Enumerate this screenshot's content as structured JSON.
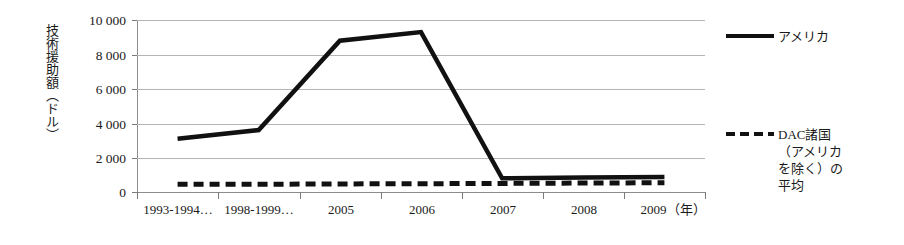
{
  "chart_data": {
    "type": "line",
    "title": "",
    "xlabel": "年",
    "ylabel": "技術援助額（ドル）",
    "ylim": [
      0,
      10000
    ],
    "ytick_values": [
      10000,
      8000,
      6000,
      4000,
      2000,
      0
    ],
    "ytick_labels": [
      "10 000",
      "8 000",
      "6 000",
      "4 000",
      "2 000",
      "0"
    ],
    "categories": [
      "1993-1994…",
      "1998-1999…",
      "2005",
      "2006",
      "2007",
      "2008",
      "2009"
    ],
    "xtick_labels": [
      "1993-1994…",
      "1998-1999…",
      "2005",
      "2006",
      "2007",
      "2008",
      "2009（年）"
    ],
    "grid": true,
    "legend_position": "right",
    "series": [
      {
        "name": "アメリカ",
        "style": "solid",
        "color": "#111111",
        "values": [
          3100,
          3600,
          8800,
          9300,
          800,
          850,
          870
        ]
      },
      {
        "name": "DAC諸国（アメリカを除く）の平均",
        "style": "dashed",
        "color": "#111111",
        "values": [
          450,
          450,
          470,
          480,
          500,
          520,
          540
        ]
      }
    ]
  },
  "axes": {
    "y_title": "技術援助額（ドル）",
    "y_ticks": [
      {
        "label": "10 000"
      },
      {
        "label": "8 000"
      },
      {
        "label": "6 000"
      },
      {
        "label": "4 000"
      },
      {
        "label": "2 000"
      },
      {
        "label": "0"
      }
    ],
    "x_ticks": [
      {
        "label": "1993-1994…"
      },
      {
        "label": "1998-1999…"
      },
      {
        "label": "2005"
      },
      {
        "label": "2006"
      },
      {
        "label": "2007"
      },
      {
        "label": "2008"
      },
      {
        "label": "2009（年）"
      }
    ]
  },
  "legend": {
    "entries": [
      {
        "label": "アメリカ",
        "style": "solid"
      },
      {
        "label": "DAC諸国\n（アメリカ\nを除く）の\n平均",
        "style": "dashed"
      }
    ],
    "entry_1_label": "アメリカ",
    "entry_2_line_1": "DAC諸国",
    "entry_2_line_2": "（アメリカ",
    "entry_2_line_3": "を除く）の",
    "entry_2_line_4": "平均"
  }
}
